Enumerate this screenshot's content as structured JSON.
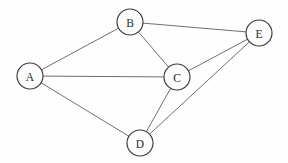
{
  "diagram": {
    "width": 288,
    "height": 163,
    "background_color": "#fefefe",
    "edge_color": "#6f6f6f",
    "node_fill_color": "#fdfdfd",
    "node_stroke_color": "#3a3a3a",
    "label_color": "#2b2b2b",
    "node_radius": 13,
    "nodes": [
      {
        "id": "A",
        "label": "A",
        "x": 30,
        "y": 76
      },
      {
        "id": "B",
        "label": "B",
        "x": 130,
        "y": 22
      },
      {
        "id": "C",
        "label": "C",
        "x": 177,
        "y": 77
      },
      {
        "id": "D",
        "label": "D",
        "x": 140,
        "y": 143
      },
      {
        "id": "E",
        "label": "E",
        "x": 259,
        "y": 33
      }
    ],
    "edges": [
      {
        "from": "A",
        "to": "B"
      },
      {
        "from": "A",
        "to": "C"
      },
      {
        "from": "A",
        "to": "D"
      },
      {
        "from": "B",
        "to": "C"
      },
      {
        "from": "B",
        "to": "E"
      },
      {
        "from": "C",
        "to": "D"
      },
      {
        "from": "C",
        "to": "E"
      },
      {
        "from": "D",
        "to": "E"
      }
    ]
  }
}
